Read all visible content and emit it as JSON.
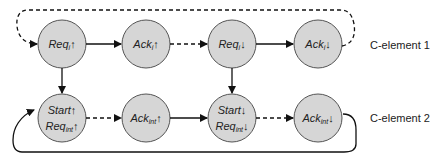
{
  "diagram": {
    "colors": {
      "node_fill": "#d6d6d6",
      "node_stroke": "#555555",
      "edge": "#111111"
    },
    "row_labels": [
      "C-element 1",
      "C-element 2"
    ],
    "nodes": [
      {
        "id": "n1",
        "base": "Req",
        "sub": "i",
        "arrow": "↑"
      },
      {
        "id": "n2",
        "base": "Ack",
        "sub": "i",
        "arrow": "↑"
      },
      {
        "id": "n3",
        "base": "Req",
        "sub": "i",
        "arrow": "↓"
      },
      {
        "id": "n4",
        "base": "Ack",
        "sub": "i",
        "arrow": "↓"
      },
      {
        "id": "n5a",
        "base": "Start",
        "sub": "",
        "arrow": "↑"
      },
      {
        "id": "n5b",
        "base": "Req",
        "sub": "int",
        "arrow": "↑"
      },
      {
        "id": "n6",
        "base": "Ack",
        "sub": "int",
        "arrow": "↑"
      },
      {
        "id": "n7a",
        "base": "Start",
        "sub": "",
        "arrow": "↓"
      },
      {
        "id": "n7b",
        "base": "Req",
        "sub": "int",
        "arrow": "↓"
      },
      {
        "id": "n8",
        "base": "Ack",
        "sub": "int",
        "arrow": "↓"
      }
    ],
    "edges": [
      {
        "from": "Req_i↑",
        "to": "Ack_i↑",
        "style": "solid"
      },
      {
        "from": "Ack_i↑",
        "to": "Req_i↓",
        "style": "dashed"
      },
      {
        "from": "Req_i↓",
        "to": "Ack_i↓",
        "style": "solid"
      },
      {
        "from": "Ack_i↓",
        "to": "Req_i↑",
        "style": "dashed"
      },
      {
        "from": "Req_i↑",
        "to": "Start↑/Req_int↑",
        "style": "solid"
      },
      {
        "from": "Req_i↓",
        "to": "Start↓/Req_int↓",
        "style": "solid"
      },
      {
        "from": "Start↑/Req_int↑",
        "to": "Ack_int↑",
        "style": "dashed"
      },
      {
        "from": "Ack_int↑",
        "to": "Start↓/Req_int↓",
        "style": "solid"
      },
      {
        "from": "Start↓/Req_int↓",
        "to": "Ack_int↓",
        "style": "dashed"
      },
      {
        "from": "Ack_int↓",
        "to": "Start↑/Req_int↑",
        "style": "solid"
      }
    ]
  }
}
